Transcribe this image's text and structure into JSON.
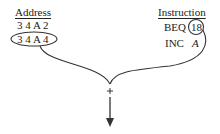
{
  "diagram": {
    "address_column": {
      "header": "Address",
      "rows": [
        "3 4 A 2",
        "3 4 A 4"
      ],
      "highlighted_row": "3 4 A 4"
    },
    "instruction_column": {
      "header": "Instruction",
      "rows": [
        {
          "opcode": "BEQ",
          "operand": "18",
          "operand_circled": true
        },
        {
          "opcode": "INC",
          "operand": "A",
          "operand_italic": true
        }
      ]
    },
    "combiner": {
      "symbol": "+",
      "output": "arrow-down"
    },
    "stroke_color": "#333333"
  }
}
